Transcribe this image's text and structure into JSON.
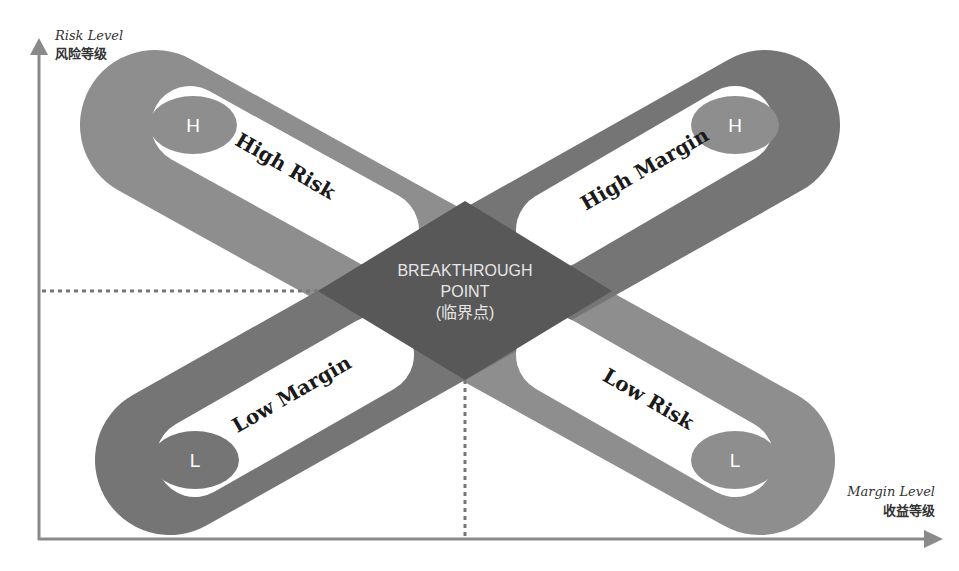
{
  "axes": {
    "y": {
      "label_en": "Risk Level",
      "label_zh": "风险等级"
    },
    "x": {
      "label_en": "Margin Level",
      "label_zh": "收益等级"
    }
  },
  "bands": [
    {
      "id": "high-risk",
      "label": "High Risk",
      "badge": "H"
    },
    {
      "id": "high-margin",
      "label": "High Margin",
      "badge": "H"
    },
    {
      "id": "low-margin",
      "label": "Low Margin",
      "badge": "L"
    },
    {
      "id": "low-risk",
      "label": "Low Risk",
      "badge": "L"
    }
  ],
  "center": {
    "line1": "BREAKTHROUGH",
    "line2": "POINT",
    "line3": "(临界点)"
  },
  "colors": {
    "band_risk": "#8e8e8e",
    "band_margin": "#757575",
    "diamond": "#585858",
    "axis": "#8a8a8a"
  }
}
